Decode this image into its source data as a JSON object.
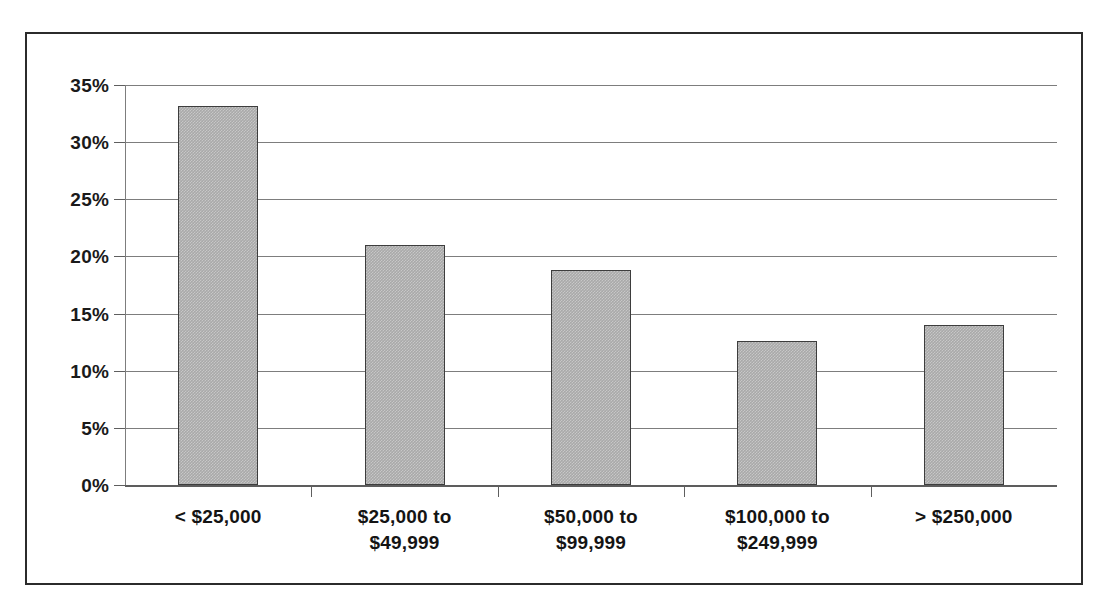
{
  "chart_data": {
    "type": "bar",
    "title": "",
    "subtitle": "",
    "xlabel": "",
    "ylabel": "",
    "categories": [
      "< $25,000",
      "$25,000 to $49,999",
      "$50,000 to $99,999",
      "$100,000 to $249,999",
      "> $250,000"
    ],
    "category_lines": [
      [
        "< $25,000",
        ""
      ],
      [
        "$25,000 to",
        "$49,999"
      ],
      [
        "$50,000 to",
        "$99,999"
      ],
      [
        "$100,000 to",
        "$249,999"
      ],
      [
        "> $250,000",
        ""
      ]
    ],
    "values": [
      33.2,
      21.0,
      18.8,
      12.6,
      14.0
    ],
    "ylim": [
      0,
      35
    ],
    "ytick_values": [
      0,
      5,
      10,
      15,
      20,
      25,
      30,
      35
    ],
    "ytick_labels": [
      "0%",
      "5%",
      "10%",
      "15%",
      "20%",
      "25%",
      "30%",
      "35%"
    ],
    "grid": true,
    "legend": false,
    "legend_position": "none",
    "bar_color": "#a9a9a9",
    "bar_border_color": "#3d3d3d",
    "gridline_color": "#7d7d7d",
    "axis_color": "#5d5d5d",
    "text_color": "#141414",
    "frame_color": "#2b2b2b",
    "background_color": "#ffffff"
  }
}
